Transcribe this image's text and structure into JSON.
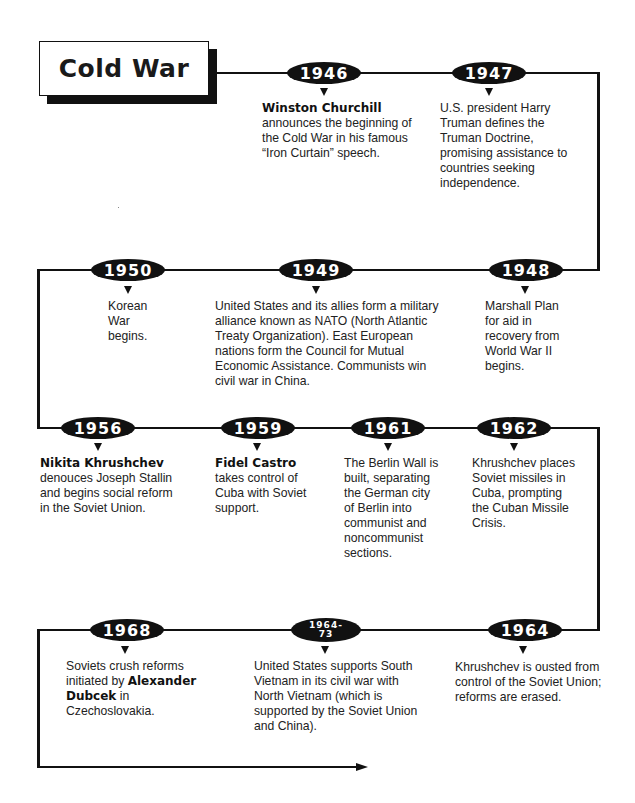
{
  "title": "Cold War",
  "events": [
    {
      "year": "1946",
      "bold": "Winston Churchill",
      "text": "announces the beginning of the Cold War in his famous “Iron Curtain” speech."
    },
    {
      "year": "1947",
      "text": "U.S. president Harry Truman defines the Truman Doctrine, promising assistance to countries seeking independence."
    },
    {
      "year": "1948",
      "text": "Marshall Plan for aid in recovery from World War II begins."
    },
    {
      "year": "1949",
      "text": "United States and its allies form a military alliance known as NATO (North Atlantic Treaty Organization). East European nations form the Council for Mutual Economic Assistance. Communists win civil war in China."
    },
    {
      "year": "1950",
      "text": "Korean War begins."
    },
    {
      "year": "1956",
      "bold": "Nikita Khrushchev",
      "text": "denouces Joseph Stallin and begins social reform in the Soviet Union."
    },
    {
      "year": "1959",
      "bold": "Fidel Castro",
      "text": "takes control of Cuba with Soviet support."
    },
    {
      "year": "1961",
      "text": "The Berlin Wall is built, separating the German city of Berlin into communist and noncommunist sections."
    },
    {
      "year": "1962",
      "text": "Khrushchev places Soviet missiles in Cuba, prompting the Cuban Missile Crisis."
    },
    {
      "year": "1964",
      "text": "Khrushchev is ousted from control of the Soviet Union; reforms are erased."
    },
    {
      "year_line1": "1964-",
      "year_line2": "73",
      "text": "United States supports South Vietnam in its civil war with North Vietnam (which is supported by the Soviet Union and China)."
    },
    {
      "year": "1968",
      "text_before": "Soviets crush reforms initiated by",
      "bold": "Alexander Dubcek",
      "text_after": "in Czechoslovakia."
    }
  ]
}
